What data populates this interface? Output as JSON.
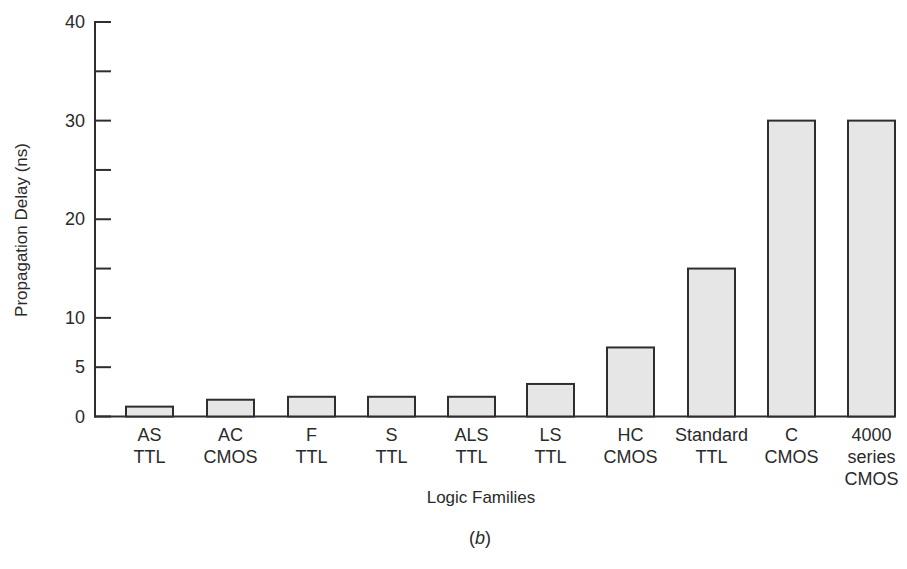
{
  "chart_data": {
    "type": "bar",
    "title": "",
    "caption": "(b)",
    "caption_letter": "b",
    "xlabel": "Logic Families",
    "ylabel": "Propagation Delay (ns)",
    "ylim": [
      0,
      40
    ],
    "yticks": [
      0,
      5,
      10,
      15,
      20,
      25,
      30,
      35,
      40
    ],
    "ytick_labels": [
      "0",
      "5",
      "10",
      "",
      "20",
      "",
      "30",
      "",
      "40"
    ],
    "grid": false,
    "legend": null,
    "categories": [
      "AS TTL",
      "AC CMOS",
      "F TTL",
      "S TTL",
      "ALS TTL",
      "LS TTL",
      "HC CMOS",
      "Standard TTL",
      "C CMOS",
      "4000 series CMOS"
    ],
    "category_labels": [
      "AS\nTTL",
      "AC\nCMOS",
      "F\nTTL",
      "S\nTTL",
      "ALS\nTTL",
      "LS\nTTL",
      "HC\nCMOS",
      "Standard\nTTL",
      "C\nCMOS",
      "4000\nseries\nCMOS"
    ],
    "values": [
      1,
      1.7,
      2,
      2,
      2,
      3.3,
      7,
      15,
      30,
      30
    ],
    "colors": {
      "bar_fill": "#e6e6e6",
      "bar_stroke": "#2e2e2e",
      "axis": "#2e2e2e",
      "text": "#2a2a2a"
    }
  }
}
